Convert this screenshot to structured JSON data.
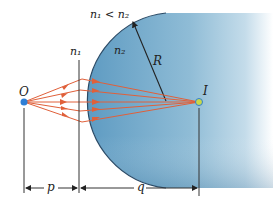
{
  "diagram": {
    "labels": {
      "condition": "n₁ < n₂",
      "n1": "n₁",
      "n2": "n₂",
      "radius": "R",
      "object": "O",
      "image": "I",
      "object_distance": "p",
      "image_distance": "q"
    },
    "colors": {
      "medium_dark": "#4f8db5",
      "medium_light": "#cfe2ee",
      "surface_edge": "#2a4a66",
      "ray": "#e0603a",
      "object_point": "#2e7fd6",
      "image_point": "#c9d84a",
      "dimension_line": "#333333"
    },
    "geometry": {
      "object_x": 24,
      "image_x": 199,
      "axis_y": 102,
      "surface_vertex_x": 79,
      "ray_count": 5
    }
  }
}
